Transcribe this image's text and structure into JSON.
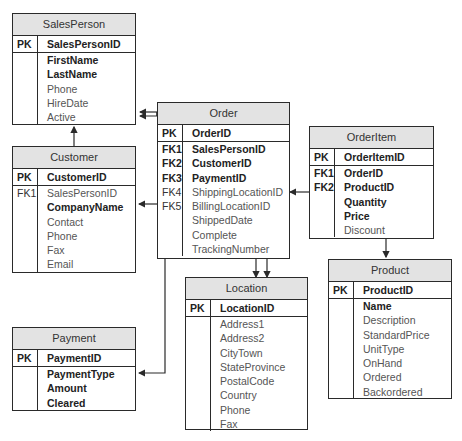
{
  "entities": {
    "salesperson": {
      "title": "SalesPerson",
      "pk": {
        "key": "PK",
        "name": "SalesPersonID"
      },
      "fields": [
        {
          "key": "",
          "name": "FirstName",
          "bold": true
        },
        {
          "key": "",
          "name": "LastName",
          "bold": true
        },
        {
          "key": "",
          "name": "Phone",
          "bold": false
        },
        {
          "key": "",
          "name": "HireDate",
          "bold": false
        },
        {
          "key": "",
          "name": "Active",
          "bold": false
        }
      ]
    },
    "customer": {
      "title": "Customer",
      "pk": {
        "key": "PK",
        "name": "CustomerID"
      },
      "fields": [
        {
          "key": "FK1",
          "name": "SalesPersonID",
          "bold": false
        },
        {
          "key": "",
          "name": "CompanyName",
          "bold": true
        },
        {
          "key": "",
          "name": "Contact",
          "bold": false
        },
        {
          "key": "",
          "name": "Phone",
          "bold": false
        },
        {
          "key": "",
          "name": "Fax",
          "bold": false
        },
        {
          "key": "",
          "name": "Email",
          "bold": false
        }
      ]
    },
    "order": {
      "title": "Order",
      "pk": {
        "key": "PK",
        "name": "OrderID"
      },
      "fields": [
        {
          "key": "FK1",
          "name": "SalesPersonID",
          "bold": true
        },
        {
          "key": "FK2",
          "name": "CustomerID",
          "bold": true
        },
        {
          "key": "FK3",
          "name": "PaymentID",
          "bold": true
        },
        {
          "key": "FK4",
          "name": "ShippingLocationID",
          "bold": false
        },
        {
          "key": "FK5",
          "name": "BillingLocationID",
          "bold": false
        },
        {
          "key": "",
          "name": "ShippedDate",
          "bold": false
        },
        {
          "key": "",
          "name": "Complete",
          "bold": false
        },
        {
          "key": "",
          "name": "TrackingNumber",
          "bold": false
        }
      ]
    },
    "orderitem": {
      "title": "OrderItem",
      "pk": {
        "key": "PK",
        "name": "OrderItemID"
      },
      "fields": [
        {
          "key": "FK1",
          "name": "OrderID",
          "bold": true
        },
        {
          "key": "FK2",
          "name": "ProductID",
          "bold": true
        },
        {
          "key": "",
          "name": "Quantity",
          "bold": true
        },
        {
          "key": "",
          "name": "Price",
          "bold": true
        },
        {
          "key": "",
          "name": "Discount",
          "bold": false
        }
      ]
    },
    "location": {
      "title": "Location",
      "pk": {
        "key": "PK",
        "name": "LocationID"
      },
      "fields": [
        {
          "key": "",
          "name": "Address1",
          "bold": false
        },
        {
          "key": "",
          "name": "Address2",
          "bold": false
        },
        {
          "key": "",
          "name": "CityTown",
          "bold": false
        },
        {
          "key": "",
          "name": "StateProvince",
          "bold": false
        },
        {
          "key": "",
          "name": "PostalCode",
          "bold": false
        },
        {
          "key": "",
          "name": "Country",
          "bold": false
        },
        {
          "key": "",
          "name": "Phone",
          "bold": false
        },
        {
          "key": "",
          "name": "Fax",
          "bold": false
        }
      ]
    },
    "product": {
      "title": "Product",
      "pk": {
        "key": "PK",
        "name": "ProductID"
      },
      "fields": [
        {
          "key": "",
          "name": "Name",
          "bold": true
        },
        {
          "key": "",
          "name": "Description",
          "bold": false
        },
        {
          "key": "",
          "name": "StandardPrice",
          "bold": false
        },
        {
          "key": "",
          "name": "UnitType",
          "bold": false
        },
        {
          "key": "",
          "name": "OnHand",
          "bold": false
        },
        {
          "key": "",
          "name": "Ordered",
          "bold": false
        },
        {
          "key": "",
          "name": "Backordered",
          "bold": false
        }
      ]
    },
    "payment": {
      "title": "Payment",
      "pk": {
        "key": "PK",
        "name": "PaymentID"
      },
      "fields": [
        {
          "key": "",
          "name": "PaymentType",
          "bold": true
        },
        {
          "key": "",
          "name": "Amount",
          "bold": true
        },
        {
          "key": "",
          "name": "Cleared",
          "bold": true
        }
      ]
    }
  },
  "relationships": [
    {
      "from": "Order.SalesPersonID",
      "to": "SalesPerson"
    },
    {
      "from": "Customer.SalesPersonID",
      "to": "SalesPerson"
    },
    {
      "from": "Order.CustomerID",
      "to": "Customer"
    },
    {
      "from": "Order.PaymentID",
      "to": "Payment"
    },
    {
      "from": "Order.ShippingLocationID",
      "to": "Location"
    },
    {
      "from": "Order.BillingLocationID",
      "to": "Location"
    },
    {
      "from": "OrderItem.OrderID",
      "to": "Order"
    },
    {
      "from": "OrderItem.ProductID",
      "to": "Product"
    }
  ],
  "colors": {
    "header_bg": "#e3e3e3",
    "border": "#2a2a2a",
    "text": "#222222",
    "muted_text": "#555555"
  }
}
